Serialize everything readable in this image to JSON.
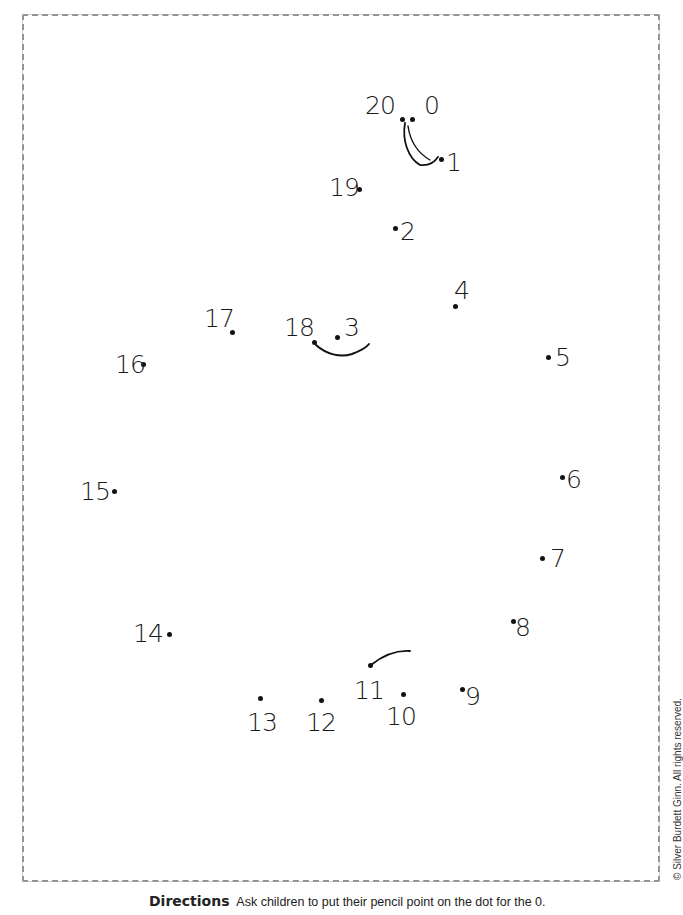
{
  "worksheet": {
    "type": "connect-the-dots",
    "directions_label": "Directions",
    "directions_text": "Ask children to put their pencil point on the dot for the 0.",
    "copyright": "© Silver Burdett Ginn. All rights reserved.",
    "colors": {
      "frame": "#8e8e8e",
      "ink": "#1a1a1a",
      "background": "#ffffff"
    }
  },
  "dots": [
    {
      "n": "0",
      "label": "0",
      "dot": [
        412,
        119
      ],
      "label_pos": [
        424,
        93
      ]
    },
    {
      "n": "1",
      "label": "1",
      "dot": [
        441,
        159
      ],
      "label_pos": [
        446,
        150
      ]
    },
    {
      "n": "2",
      "label": "2",
      "dot": [
        395,
        228
      ],
      "label_pos": [
        400,
        219
      ]
    },
    {
      "n": "3",
      "label": "3",
      "dot": [
        337,
        337
      ],
      "label_pos": [
        344,
        315
      ]
    },
    {
      "n": "4",
      "label": "4",
      "dot": [
        455,
        306
      ],
      "label_pos": [
        454,
        278
      ]
    },
    {
      "n": "5",
      "label": "5",
      "dot": [
        548,
        357
      ],
      "label_pos": [
        555,
        345
      ]
    },
    {
      "n": "6",
      "label": "6",
      "dot": [
        562,
        477
      ],
      "label_pos": [
        566,
        467
      ]
    },
    {
      "n": "7",
      "label": "7",
      "dot": [
        542,
        558
      ],
      "label_pos": [
        550,
        546
      ]
    },
    {
      "n": "8",
      "label": "8",
      "dot": [
        513,
        621
      ],
      "label_pos": [
        515,
        615
      ]
    },
    {
      "n": "9",
      "label": "9",
      "dot": [
        462,
        689
      ],
      "label_pos": [
        465,
        684
      ]
    },
    {
      "n": "10",
      "label": "10",
      "dot": [
        403,
        694
      ],
      "label_pos": [
        386,
        704
      ]
    },
    {
      "n": "11",
      "label": "11",
      "dot": [
        370,
        665
      ],
      "label_pos": [
        354,
        678
      ]
    },
    {
      "n": "12",
      "label": "12",
      "dot": [
        321,
        700
      ],
      "label_pos": [
        306,
        710
      ]
    },
    {
      "n": "13",
      "label": "13",
      "dot": [
        260,
        698
      ],
      "label_pos": [
        247,
        710
      ]
    },
    {
      "n": "14",
      "label": "14",
      "dot": [
        169,
        634
      ],
      "label_pos": [
        133,
        621
      ]
    },
    {
      "n": "15",
      "label": "15",
      "dot": [
        114,
        491
      ],
      "label_pos": [
        80,
        479
      ]
    },
    {
      "n": "16",
      "label": "16",
      "dot": [
        143,
        364
      ],
      "label_pos": [
        115,
        352
      ]
    },
    {
      "n": "17",
      "label": "17",
      "dot": [
        232,
        332
      ],
      "label_pos": [
        204,
        306
      ]
    },
    {
      "n": "18",
      "label": "18",
      "dot": [
        314,
        342
      ],
      "label_pos": [
        284,
        315
      ]
    },
    {
      "n": "19",
      "label": "19",
      "dot": [
        359,
        189
      ],
      "label_pos": [
        329,
        175
      ]
    },
    {
      "n": "20",
      "label": "20",
      "dot": [
        402,
        119
      ],
      "label_pos": [
        365,
        93
      ]
    }
  ],
  "guide_strokes": [
    {
      "name": "ear-curve",
      "path": "M405,123 C402,140 408,158 420,165 C428,166 434,163 438,157"
    },
    {
      "name": "ear-curve-inner",
      "path": "M408,126 C410,140 416,152 430,160"
    },
    {
      "name": "mouth-curve",
      "path": "M316,345 C326,354 340,358 352,354 C360,351 366,348 369,344"
    },
    {
      "name": "chin-curve",
      "path": "M371,665 C381,657 395,650 410,651"
    }
  ]
}
